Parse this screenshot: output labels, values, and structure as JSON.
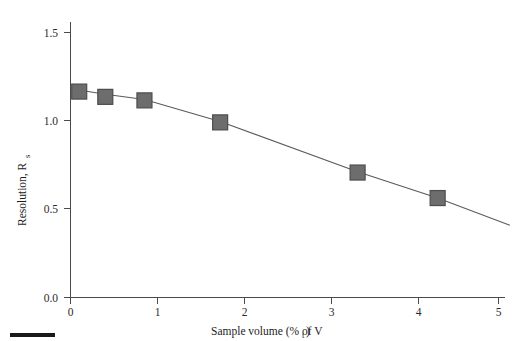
{
  "chart_data": {
    "type": "scatter",
    "title": "",
    "subtitle": "",
    "xlabel": "Sample volume (% of V",
    "xlabel_sub": "t",
    "xlabel_tail": " )",
    "ylabel": "Resolution, R",
    "ylabel_sub": "s",
    "xlim": [
      0,
      5.25
    ],
    "ylim": [
      0.0,
      1.62
    ],
    "grid": false,
    "legend": null,
    "x_ticks": [
      "0",
      "1",
      "2",
      "3",
      "4",
      "5"
    ],
    "x_tick_values": [
      0,
      1,
      2,
      3,
      4,
      5
    ],
    "y_ticks": [
      "0.0",
      "0.5",
      "1.0",
      "1.5"
    ],
    "y_tick_values": [
      0.0,
      0.5,
      1.0,
      1.5
    ],
    "series": [
      {
        "name": "Resolution vs sample volume",
        "marker": "square",
        "marker_color": "#6d6d6d",
        "marker_edge_color": "#4d4d4d",
        "line_color": "#5a5a5a",
        "x": [
          0.1,
          0.4,
          0.85,
          1.72,
          3.3,
          4.22
        ],
        "y": [
          1.17,
          1.14,
          1.12,
          0.995,
          0.71,
          0.565
        ]
      }
    ],
    "fit_curve": {
      "name": "trend-line",
      "x": [
        0.02,
        0.4,
        0.85,
        1.72,
        3.3,
        4.22,
        5.05
      ],
      "y": [
        1.185,
        1.155,
        1.125,
        1.0,
        0.715,
        0.565,
        0.41
      ]
    }
  },
  "figure": {
    "caption": "",
    "corner_marker": ""
  }
}
